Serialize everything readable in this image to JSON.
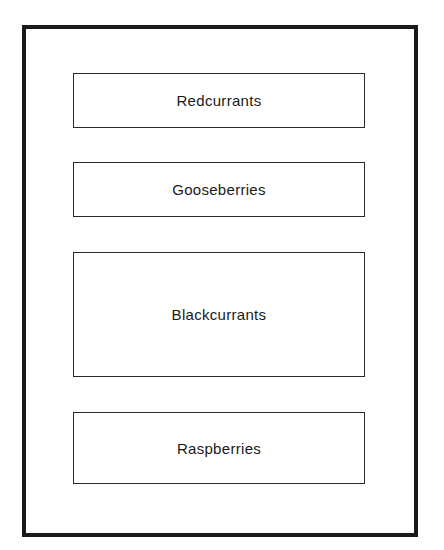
{
  "diagram": {
    "beds": [
      {
        "label": "Redcurrants"
      },
      {
        "label": "Gooseberries"
      },
      {
        "label": "Blackcurrants"
      },
      {
        "label": "Raspberries"
      }
    ]
  }
}
